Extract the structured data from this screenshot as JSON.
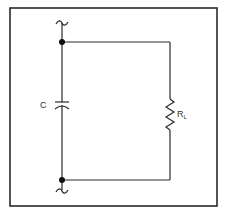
{
  "diagram": {
    "type": "circuit-schematic",
    "components": {
      "capacitor": {
        "label": "C"
      },
      "resistor": {
        "label": "R",
        "subscript": "L"
      }
    },
    "nodes": [
      "top-junction",
      "bottom-junction"
    ],
    "colors": {
      "line": "#2a2a2a",
      "node": "#111111",
      "background": "#ffffff"
    }
  }
}
